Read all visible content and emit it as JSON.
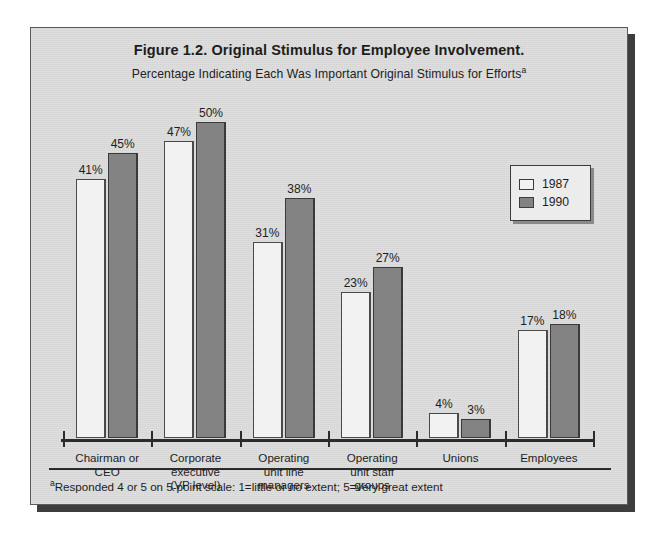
{
  "figure": {
    "title": "Figure 1.2. Original Stimulus for Employee Involvement.",
    "subtitle": "Percentage Indicating Each Was Important Original Stimulus for Efforts",
    "subtitle_superscript": "a",
    "footnote_superscript": "a",
    "footnote": "Responded 4 or 5 on 5-point scale: 1=little or no extent; 5=very great extent"
  },
  "legend": {
    "position": "right-upper",
    "entries": [
      {
        "label": "1987",
        "swatch": "white-square",
        "color": "#f2f2f2"
      },
      {
        "label": "1990",
        "swatch": "gray-square",
        "color": "#838383"
      }
    ]
  },
  "chart_data": {
    "type": "bar",
    "title": "Figure 1.2. Original Stimulus for Employee Involvement.",
    "subtitle": "Percentage Indicating Each Was Important Original Stimulus for Efforts",
    "xlabel": "",
    "ylabel": "",
    "ylim": [
      0,
      55
    ],
    "grid": false,
    "legend_position": "right-upper",
    "value_suffix": "%",
    "categories": [
      "Chairman or CEO",
      "Corporate executive (VP level)",
      "Operating unit line managers",
      "Operating unit staff groups",
      "Unions",
      "Employees"
    ],
    "category_lines": [
      [
        "Chairman or",
        "CEO"
      ],
      [
        "Corporate",
        "executive",
        "(VP level)"
      ],
      [
        "Operating",
        "unit line",
        "managers"
      ],
      [
        "Operating",
        "unit staff",
        "groups"
      ],
      [
        "Unions"
      ],
      [
        "Employees"
      ]
    ],
    "series": [
      {
        "name": "1987",
        "color": "#f2f2f2",
        "values": [
          41,
          47,
          31,
          23,
          4,
          17
        ],
        "labels": [
          "41%",
          "47%",
          "31%",
          "23%",
          "4%",
          "17%"
        ]
      },
      {
        "name": "1990",
        "color": "#838383",
        "values": [
          45,
          50,
          38,
          27,
          3,
          18
        ],
        "labels": [
          "45%",
          "50%",
          "38%",
          "27%",
          "3%",
          "18%"
        ]
      }
    ]
  }
}
